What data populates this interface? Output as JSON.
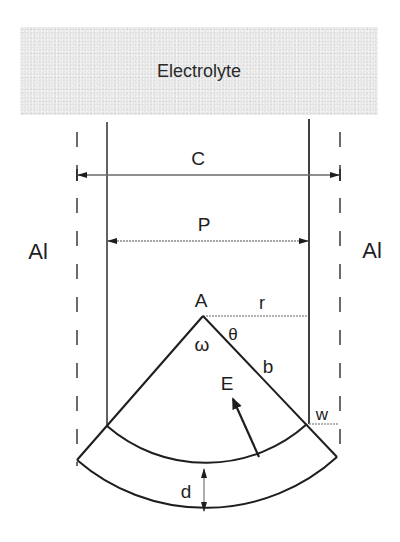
{
  "electrolyte": {
    "label": "Electrolyte"
  },
  "labels": {
    "left_material": "Al",
    "right_material": "Al",
    "outer_width": "C",
    "inner_width": "P",
    "apex": "A",
    "radius_horizontal": "r",
    "half_angle": "θ",
    "full_angle": "ω",
    "side_length": "b",
    "field": "E",
    "wall_thickness": "w",
    "layer_depth": "d"
  },
  "colors": {
    "line": "#1e1e1e",
    "dimension_line": "#6a6a6a",
    "electrolyte_fill": "#e6e6e6"
  }
}
